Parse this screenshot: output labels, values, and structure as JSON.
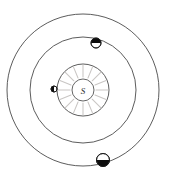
{
  "diagram": {
    "background_color": "#ffffff",
    "center": {
      "x": 83,
      "y": 90
    },
    "sun": {
      "label": "S",
      "name": "Sun",
      "radius": 11,
      "ray_count": 16,
      "ray_inner_radius": 13,
      "ray_outer_radius": 25,
      "ray_color": "#c9c6c4",
      "disc_fill": "#ffffff",
      "disc_stroke": "#555555"
    },
    "orbits": [
      {
        "name": "inner-orbit",
        "radius": 26,
        "stroke": "#4a4a4a",
        "stroke_width": 0.9
      },
      {
        "name": "middle-orbit",
        "radius": 53,
        "stroke": "#4a4a4a",
        "stroke_width": 0.9
      },
      {
        "name": "outer-orbit",
        "radius": 76,
        "stroke": "#4a4a4a",
        "stroke_width": 0.9
      }
    ],
    "planets": [
      {
        "name": "inner-planet",
        "orbit": "inner-orbit",
        "x": 54,
        "y": 89,
        "radius": 3,
        "shading": "dark-left",
        "light_fill": "#ffffff",
        "dark_fill": "#0d0d0d",
        "stroke": "#1a1a1a"
      },
      {
        "name": "middle-planet",
        "orbit": "middle-orbit",
        "x": 96,
        "y": 43,
        "radius": 5,
        "shading": "dark-top",
        "light_fill": "#ffffff",
        "dark_fill": "#0d0d0d",
        "stroke": "#1a1a1a"
      },
      {
        "name": "outer-planet",
        "orbit": "outer-orbit",
        "x": 103,
        "y": 160,
        "radius": 6.5,
        "shading": "dark-bottom",
        "light_fill": "#ffffff",
        "dark_fill": "#0d0d0d",
        "stroke": "#1a1a1a"
      }
    ]
  }
}
